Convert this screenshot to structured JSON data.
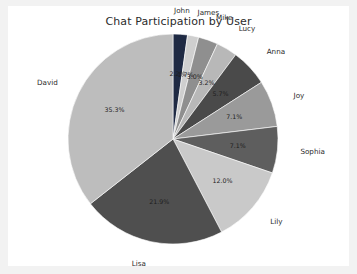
{
  "figure": {
    "background": "#ffffff",
    "page_background": "#f2f2f2"
  },
  "chart_data": {
    "type": "pie",
    "title": "Chat Participation by User",
    "xlabel": "",
    "ylabel": "",
    "legend_position": "none",
    "labels_outside": true,
    "startangle_deg": 90,
    "direction": "clockwise",
    "categories": [
      "John",
      "James",
      "Mike",
      "Lucy",
      "Anna",
      "Joy",
      "Sophia",
      "Lily",
      "Lisa",
      "David"
    ],
    "values": [
      2.2,
      1.7,
      3.0,
      3.2,
      5.7,
      7.1,
      7.1,
      12.0,
      21.9,
      35.3
    ],
    "labels_pct": [
      "2.2%",
      "1.7%",
      "3.0%",
      "3.2%",
      "5.7%",
      "7.1%",
      "7.1%",
      "12.0%",
      "21.9%",
      "35.3%"
    ],
    "colors": [
      "#1f2a44",
      "#cfcfcf",
      "#8f8f8f",
      "#b8b8b8",
      "#4a4a4a",
      "#9a9a9a",
      "#5e5e5e",
      "#c9c9c9",
      "#4f4f4f",
      "#bdbdbd"
    ]
  }
}
